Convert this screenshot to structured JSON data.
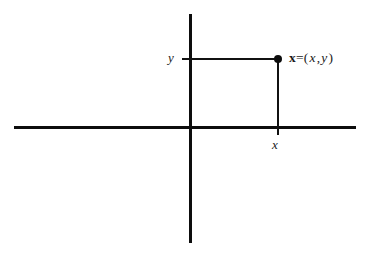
{
  "figure": {
    "background_color": "#ffffff",
    "ink_color": "#0d0d0d",
    "width": 367,
    "height": 256
  },
  "axes": {
    "horizontal_name": "x-axis",
    "vertical_name": "y-axis",
    "origin": {
      "x": 190,
      "y": 127
    }
  },
  "labels": {
    "y_axis_value": "y",
    "x_axis_value": "x",
    "point": {
      "vector_name": "x",
      "equals": "=",
      "open_paren": "(",
      "first_coord": "x",
      "comma": ",",
      "second_coord": "y",
      "close_paren": ")"
    }
  },
  "chart_data": {
    "type": "scatter",
    "title": "",
    "subtitle": "",
    "xlabel": "x",
    "ylabel": "y",
    "grid": false,
    "legend": null,
    "axis_style": "cartesian-cross",
    "xlim": [
      -176,
      166
    ],
    "ylim": [
      -116,
      113
    ],
    "points": [
      {
        "label": "x=(x,y)",
        "x": 88,
        "y": 68,
        "marker": "filled-circle",
        "marker_size": 8,
        "projection_to_x_axis": true,
        "projection_to_y_axis": true
      }
    ],
    "annotations": [
      {
        "text": "y",
        "attached_to": "y-axis",
        "position": "left-of-axis"
      },
      {
        "text": "x",
        "attached_to": "x-axis",
        "position": "below-axis"
      },
      {
        "text": "x=(x,y)",
        "attached_to": "point",
        "position": "right-of-marker"
      }
    ]
  }
}
